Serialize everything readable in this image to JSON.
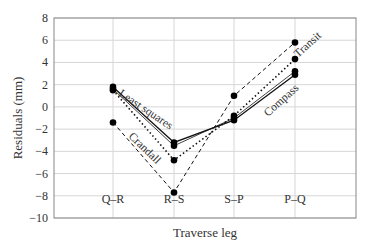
{
  "chart_data": {
    "type": "line",
    "title": "",
    "xlabel": "Traverse leg",
    "ylabel": "Residuals (mm)",
    "categories": [
      "Q–R",
      "R–S",
      "S–P",
      "P–Q"
    ],
    "ylim": [
      -10,
      8
    ],
    "yticks": [
      8,
      6,
      4,
      2,
      0,
      -2,
      -4,
      -6,
      -8,
      -10
    ],
    "ytick_labels": [
      "8",
      "6",
      "4",
      "2",
      "0",
      "−2",
      "−4",
      "−6",
      "−8",
      "−10"
    ],
    "grid": true,
    "legend": "inline labels",
    "series": [
      {
        "name": "Least squares",
        "style": "solid",
        "values": [
          1.8,
          -3.2,
          -1.2,
          2.9
        ]
      },
      {
        "name": "Compass",
        "style": "solid-thin",
        "values": [
          1.6,
          -3.5,
          -1.0,
          3.2
        ]
      },
      {
        "name": "Transit",
        "style": "dotted",
        "values": [
          1.5,
          -4.8,
          -0.8,
          4.3
        ]
      },
      {
        "name": "Crandall",
        "style": "dashed",
        "values": [
          -1.4,
          -7.7,
          1.0,
          5.8
        ]
      }
    ],
    "annotations": [
      {
        "text": "Least squares",
        "near": "Q–R to R–S segment"
      },
      {
        "text": "Crandall",
        "near": "Q–R to R–S segment (lower)"
      },
      {
        "text": "Transit",
        "near": "P–Q upper"
      },
      {
        "text": "Compass",
        "near": "S–P to P–Q segment"
      }
    ]
  }
}
